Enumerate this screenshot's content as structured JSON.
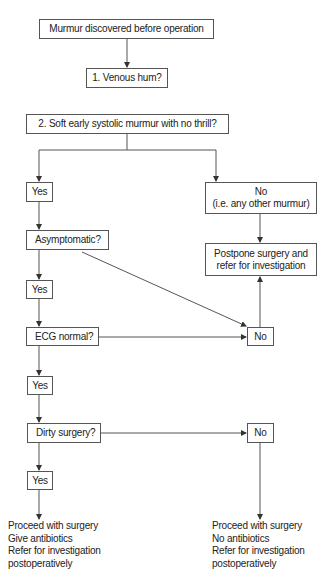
{
  "flowchart": {
    "start": "Murmur discovered before operation",
    "q1": "1. Venous hum?",
    "q2": "2. Soft early systolic murmur with no thrill?",
    "q2_yes": "Yes",
    "q2_no": "No\n(i.e. any other murmur)",
    "postpone": "Postpone surgery and\nrefer for investigation",
    "q3": "Asymptomatic?",
    "q3_yes": "Yes",
    "q4": "ECG normal?",
    "q4_no": "No",
    "q4_yes": "Yes",
    "q5": "Dirty surgery?",
    "q5_no": "No",
    "q5_yes": "Yes",
    "outcome_yes": "Proceed with surgery\nGive antibiotics\nRefer for investigation\npostoperatively",
    "outcome_no": "Proceed with surgery\nNo antibiotics\nRefer for investigation\npostoperatively"
  },
  "colors": {
    "line": "#555555",
    "text": "#222222",
    "background": "#ffffff"
  }
}
